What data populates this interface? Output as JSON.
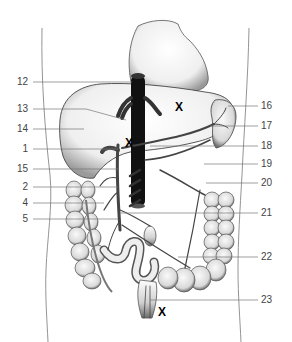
{
  "figure": {
    "labels_left": [
      {
        "id": "12",
        "y": 82
      },
      {
        "id": "13",
        "y": 108
      },
      {
        "id": "14",
        "y": 129
      },
      {
        "id": "1",
        "y": 149
      },
      {
        "id": "15",
        "y": 169
      },
      {
        "id": "2",
        "y": 187
      },
      {
        "id": "4",
        "y": 203
      },
      {
        "id": "5",
        "y": 219
      }
    ],
    "labels_right": [
      {
        "id": "16",
        "y": 106
      },
      {
        "id": "17",
        "y": 126
      },
      {
        "id": "18",
        "y": 146
      },
      {
        "id": "19",
        "y": 164
      },
      {
        "id": "20",
        "y": 183
      },
      {
        "id": "21",
        "y": 213
      },
      {
        "id": "22",
        "y": 257
      },
      {
        "id": "23",
        "y": 300
      }
    ],
    "x_marks": [
      {
        "label": "X",
        "x": 175,
        "y": 102
      },
      {
        "label": "X",
        "x": 125,
        "y": 138
      },
      {
        "label": "X",
        "x": 158,
        "y": 306
      }
    ]
  }
}
